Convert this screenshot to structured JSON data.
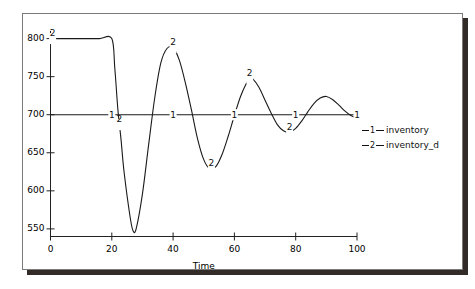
{
  "chart_data": {
    "type": "line",
    "title": "",
    "xlabel": "Time",
    "ylabel": "",
    "xlim": [
      0,
      100
    ],
    "ylim": [
      540,
      810
    ],
    "xticks": [
      "0",
      "20",
      "40",
      "60",
      "80",
      "100"
    ],
    "xtick_values": [
      0,
      20,
      40,
      60,
      80,
      100
    ],
    "yticks": [
      "550",
      "600",
      "650",
      "700",
      "750",
      "800"
    ],
    "ytick_values": [
      550,
      600,
      650,
      700,
      750,
      800
    ],
    "grid": false,
    "legend_position": "right",
    "series": [
      {
        "name": "inventory",
        "marker": "1",
        "x": [
          0,
          20,
          40,
          60,
          80,
          100
        ],
        "values": [
          700,
          700,
          700,
          700,
          700,
          700
        ]
      },
      {
        "name": "inventory_d",
        "marker": "2",
        "x": [
          0,
          4,
          8,
          12,
          16,
          20,
          21,
          22,
          23,
          24,
          26,
          27,
          28,
          30,
          32,
          34,
          36,
          38,
          40,
          42,
          44,
          46,
          48,
          50,
          52,
          54,
          56,
          58,
          60,
          62,
          64,
          65,
          66,
          68,
          70,
          72,
          74,
          76,
          78,
          80,
          82,
          84,
          86,
          88,
          90,
          92,
          94,
          96,
          98,
          100
        ],
        "values": [
          800,
          800,
          800,
          800,
          800,
          800,
          760,
          706,
          668,
          625,
          565,
          547,
          551,
          596,
          660,
          722,
          768,
          787,
          788,
          772,
          742,
          706,
          668,
          641,
          629,
          632,
          648,
          672,
          699,
          724,
          742,
          748,
          747,
          736,
          719,
          702,
          687,
          679,
          677,
          682,
          692,
          704,
          715,
          722,
          724,
          720,
          713,
          705,
          699,
          696
        ]
      }
    ]
  },
  "legend": {
    "items": [
      {
        "marker": "1",
        "label": "inventory"
      },
      {
        "marker": "2",
        "label": "inventory_d"
      }
    ]
  },
  "axes": {
    "x_title": "Time"
  },
  "curve_labels": {
    "series1": [
      "1",
      "1",
      "1",
      "1",
      "1"
    ],
    "series2": [
      "2",
      "2",
      "2",
      "2",
      "2"
    ]
  }
}
